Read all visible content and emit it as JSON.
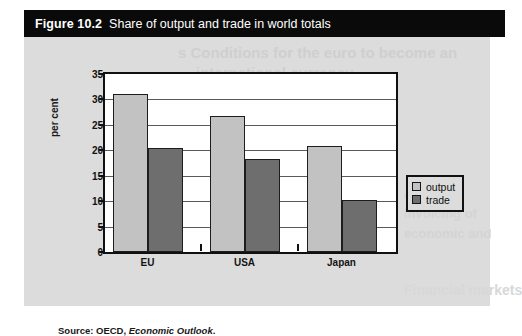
{
  "figure": {
    "number": "Figure 10.2",
    "caption": "Share of output and trade in world totals",
    "source_prefix": "Source: OECD,",
    "source_publication": "Economic Outlook",
    "source_suffix": "."
  },
  "ghost_text": {
    "line1": "s Conditions for the euro to become an",
    "line2": "international currency",
    "line3": "and from",
    "line4": "invoicing of",
    "line5": "economic and",
    "line6": "Financial markets"
  },
  "legend": {
    "position": "right",
    "items": [
      {
        "label": "output",
        "color": "#c2c2c2"
      },
      {
        "label": "trade",
        "color": "#6e6e6e"
      }
    ]
  },
  "chart_data": {
    "type": "bar",
    "title": "Share of output and trade in world totals",
    "xlabel": "",
    "ylabel": "per cent",
    "categories": [
      "EU",
      "USA",
      "Japan"
    ],
    "series": [
      {
        "name": "output",
        "color": "#c2c2c2",
        "values": [
          31.0,
          26.7,
          20.8
        ]
      },
      {
        "name": "trade",
        "color": "#6e6e6e",
        "values": [
          20.5,
          18.2,
          10.2
        ]
      }
    ],
    "ylim": [
      0,
      35
    ],
    "yticks": [
      0,
      5,
      10,
      15,
      20,
      25,
      30,
      35
    ],
    "ytick_labels": [
      "0",
      "5",
      "10",
      "15",
      "20",
      "25",
      "30",
      "35"
    ],
    "grid": true,
    "grid_axis": "y",
    "legend_position": "right outside"
  }
}
